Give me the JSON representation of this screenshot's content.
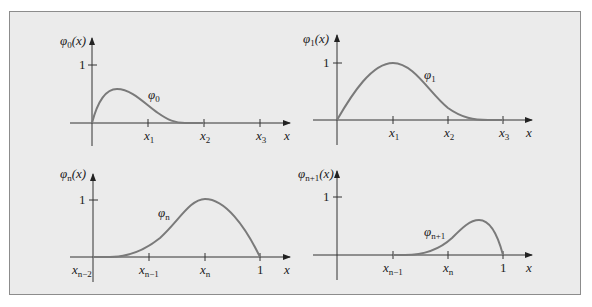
{
  "figure": {
    "background_color": "#ebebeb",
    "border_color": "#8c8c8c",
    "curve_color": "#7a7a7a",
    "panels": [
      {
        "id": "phi0",
        "y_axis_label": "φ0(x)",
        "y_axis_label_base": "φ",
        "y_axis_label_sub": "0",
        "y_axis_label_arg": "(x)",
        "y_tick_label": "1",
        "curve_label_base": "φ",
        "curve_label_sub": "0",
        "x_axis_label": "x",
        "x_ticks": [
          {
            "base": "x",
            "sub": "1"
          },
          {
            "base": "x",
            "sub": "2"
          },
          {
            "base": "x",
            "sub": "3"
          }
        ]
      },
      {
        "id": "phi1",
        "y_axis_label": "φ1(x)",
        "y_axis_label_base": "φ",
        "y_axis_label_sub": "1",
        "y_axis_label_arg": "(x)",
        "y_tick_label": "1",
        "curve_label_base": "φ",
        "curve_label_sub": "1",
        "x_axis_label": "x",
        "x_ticks": [
          {
            "base": "x",
            "sub": "1"
          },
          {
            "base": "x",
            "sub": "2"
          },
          {
            "base": "x",
            "sub": "3"
          }
        ]
      },
      {
        "id": "phin",
        "y_axis_label": "φn(x)",
        "y_axis_label_base": "φ",
        "y_axis_label_sub": "n",
        "y_axis_label_arg": "(x)",
        "y_tick_label": "1",
        "curve_label_base": "φ",
        "curve_label_sub": "n",
        "x_axis_label": "x",
        "x_ticks": [
          {
            "base": "x",
            "sub": "n−2"
          },
          {
            "base": "x",
            "sub": "n−1"
          },
          {
            "base": "x",
            "sub": "n"
          },
          {
            "base": "1",
            "sub": ""
          }
        ]
      },
      {
        "id": "phin1",
        "y_axis_label": "φn+1(x)",
        "y_axis_label_base": "φ",
        "y_axis_label_sub": "n+1",
        "y_axis_label_arg": "(x)",
        "y_tick_label": "1",
        "curve_label_base": "φ",
        "curve_label_sub": "n+1",
        "x_axis_label": "x",
        "x_ticks": [
          {
            "base": "x",
            "sub": "n−1"
          },
          {
            "base": "x",
            "sub": "n"
          },
          {
            "base": "1",
            "sub": ""
          }
        ]
      }
    ]
  }
}
